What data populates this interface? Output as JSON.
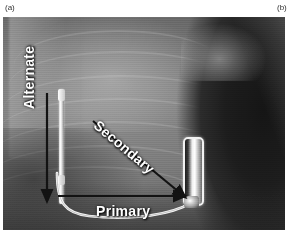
{
  "figure": {
    "panels": [
      {
        "id": "panel-a",
        "label": "(a)"
      },
      {
        "id": "panel-b",
        "label": "(b)"
      }
    ],
    "image": {
      "kind": "chest-radiograph",
      "description": "Grayscale antero-posterior chest radiograph showing an implanted subcutaneous defibrillator: a vertical parasternal lead on the left, a pulse-generator can on the left lateral chest wall, and three annotated sensing vectors."
    },
    "annotations": [
      {
        "name": "alternate-vector",
        "label": "Alternate",
        "orientation": "vertical",
        "rotation_deg": -90,
        "arrow_color": "#1a1a1a"
      },
      {
        "name": "secondary-vector",
        "label": "Secondary",
        "orientation": "diagonal",
        "rotation_deg": 40,
        "arrow_color": "#1a1a1a"
      },
      {
        "name": "primary-vector",
        "label": "Primary",
        "orientation": "horizontal",
        "rotation_deg": 0,
        "arrow_color": "#1a1a1a"
      }
    ],
    "hardware": [
      {
        "name": "parasternal-lead",
        "type": "lead",
        "color": "#ffffff"
      },
      {
        "name": "pulse-generator-can",
        "type": "device",
        "color": "#f2f2f2"
      },
      {
        "name": "tunneled-lead-body",
        "type": "lead",
        "color": "#ffffff"
      }
    ],
    "colors": {
      "background": "#ffffff",
      "panel_label": "#303030",
      "annotation_text": "#ffffff",
      "film_mid": "#7b7b7b",
      "film_dark": "#1d1d1d",
      "film_light": "#d7d7d7"
    }
  }
}
